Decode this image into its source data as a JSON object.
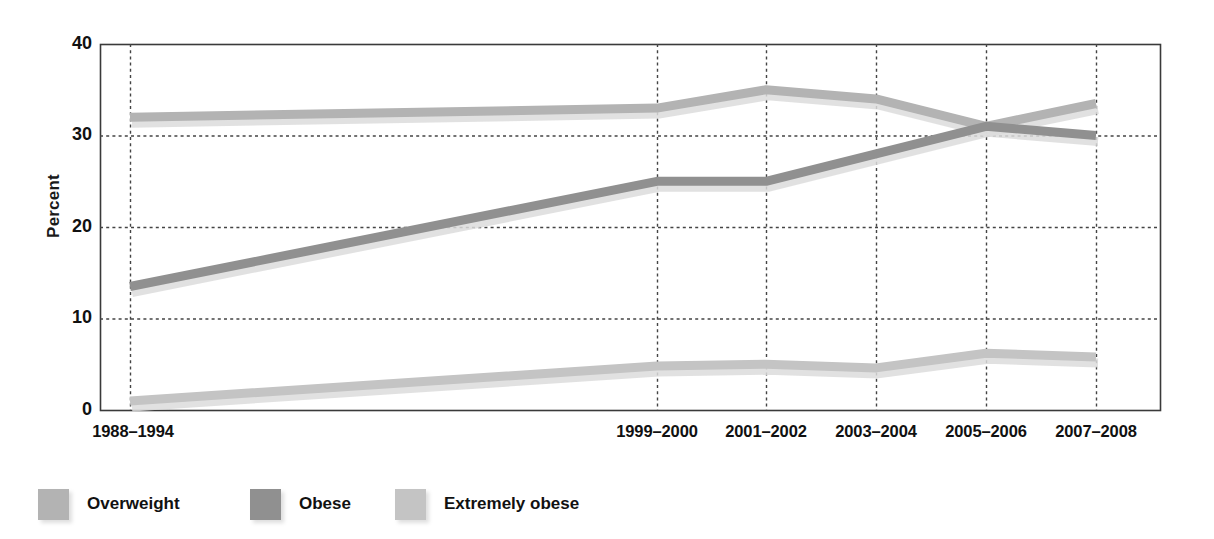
{
  "chart_data": {
    "type": "line",
    "title": "",
    "xlabel": "",
    "ylabel": "Percent",
    "ylim": [
      0,
      40
    ],
    "yticks": [
      0,
      10,
      20,
      30,
      40
    ],
    "grid": "dotted-both",
    "legend_position": "below-left",
    "categories": [
      "1988–1994",
      "1999–2000",
      "2001–2002",
      "2003–2004",
      "2005–2006",
      "2007–2008"
    ],
    "series": [
      {
        "name": "Overweight",
        "color": "#b3b3b3",
        "values": [
          32.0,
          33.0,
          35.0,
          34.0,
          31.0,
          33.5
        ]
      },
      {
        "name": "Obese",
        "color": "#909090",
        "values": [
          13.5,
          25.0,
          25.0,
          28.0,
          31.0,
          30.0
        ]
      },
      {
        "name": "Extremely obese",
        "color": "#c4c4c4",
        "values": [
          1.0,
          4.8,
          5.0,
          4.6,
          6.2,
          5.8
        ]
      }
    ]
  },
  "axis": {
    "y_label": "Percent",
    "y_tick_labels": [
      "40",
      "30",
      "20",
      "10",
      "0"
    ],
    "x_tick_labels": [
      "1988–1994",
      "1999–2000",
      "2001–2002",
      "2003–2004",
      "2005–2006",
      "2007–2008"
    ]
  },
  "legend": {
    "items": [
      {
        "label": "Overweight",
        "color": "#b3b3b3"
      },
      {
        "label": "Obese",
        "color": "#909090"
      },
      {
        "label": "Extremely obese",
        "color": "#c4c4c4"
      }
    ]
  },
  "colors": {
    "frame": "#3a3a3a",
    "grid": "#444444",
    "text": "#111111",
    "background": "#ffffff",
    "shadow": "#dcdcdc"
  }
}
